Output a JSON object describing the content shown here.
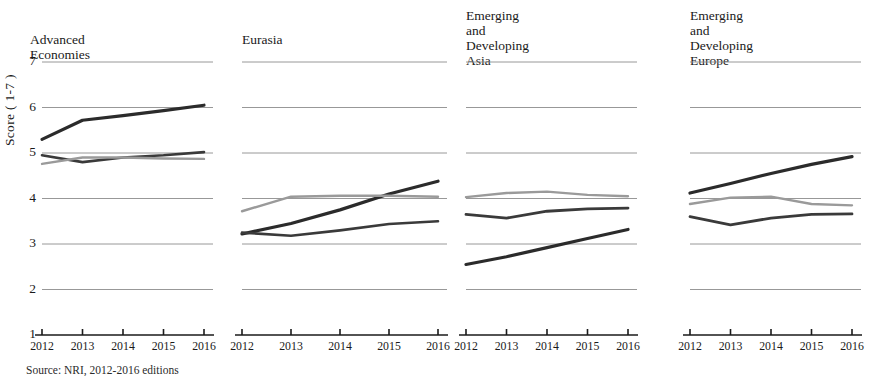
{
  "figure": {
    "ylabel": "Score ( 1-7 )",
    "source_note": "Source: NRI, 2012-2016 editions"
  },
  "chart_data": {
    "type": "line",
    "title": "",
    "xlabel": "",
    "ylabel": "Score ( 1-7 )",
    "ylim": [
      1,
      7
    ],
    "yticks": [
      1,
      2,
      3,
      4,
      5,
      6,
      7
    ],
    "grid": true,
    "legend_position": "none",
    "x": [
      "2012",
      "2013",
      "2014",
      "2015",
      "2016"
    ],
    "colors": {
      "series_dark": "#2b2b2b",
      "series_mid": "#4a4a4a",
      "series_light": "#9a9a9a",
      "gridline": "#8c8c8c",
      "axis": "#1a1a1a"
    },
    "panels": [
      {
        "title": "Advanced Economies",
        "series": [
          {
            "name": "series-1",
            "color": "#2b2b2b",
            "width": 3.2,
            "values": [
              5.3,
              5.72,
              5.82,
              5.93,
              6.05
            ]
          },
          {
            "name": "series-2",
            "color": "#3a3a3a",
            "width": 2.6,
            "values": [
              4.95,
              4.8,
              4.9,
              4.95,
              5.02
            ]
          },
          {
            "name": "series-3",
            "color": "#9a9a9a",
            "width": 2.4,
            "values": [
              4.76,
              4.9,
              4.9,
              4.88,
              4.87
            ]
          }
        ]
      },
      {
        "title": "Eurasia",
        "series": [
          {
            "name": "series-1",
            "color": "#2b2b2b",
            "width": 3.2,
            "values": [
              3.22,
              3.45,
              3.75,
              4.1,
              4.38
            ]
          },
          {
            "name": "series-2",
            "color": "#3a3a3a",
            "width": 2.6,
            "values": [
              3.25,
              3.18,
              3.3,
              3.44,
              3.5
            ]
          },
          {
            "name": "series-3",
            "color": "#9a9a9a",
            "width": 2.4,
            "values": [
              3.72,
              4.04,
              4.06,
              4.06,
              4.04
            ]
          }
        ]
      },
      {
        "title": "Emerging and\nDeveloping Asia",
        "series": [
          {
            "name": "series-1",
            "color": "#3a3a3a",
            "width": 2.8,
            "values": [
              3.65,
              3.57,
              3.72,
              3.77,
              3.79
            ]
          },
          {
            "name": "series-2",
            "color": "#2b2b2b",
            "width": 3.2,
            "values": [
              2.55,
              2.72,
              2.92,
              3.12,
              3.32
            ]
          },
          {
            "name": "series-3",
            "color": "#9a9a9a",
            "width": 2.4,
            "values": [
              4.03,
              4.12,
              4.15,
              4.08,
              4.05
            ]
          }
        ]
      },
      {
        "title": "Emerging and\nDeveloping Europe",
        "series": [
          {
            "name": "series-1",
            "color": "#2b2b2b",
            "width": 3.2,
            "values": [
              4.12,
              4.33,
              4.55,
              4.75,
              4.92
            ]
          },
          {
            "name": "series-2",
            "color": "#3a3a3a",
            "width": 2.8,
            "values": [
              3.6,
              3.42,
              3.57,
              3.65,
              3.66
            ]
          },
          {
            "name": "series-3",
            "color": "#9a9a9a",
            "width": 2.4,
            "values": [
              3.88,
              4.02,
              4.04,
              3.88,
              3.85
            ]
          }
        ]
      }
    ]
  },
  "layout": {
    "panels": [
      {
        "left": 34,
        "plot_left": 42,
        "plot_width": 162,
        "title_left": 30,
        "title_top": 32
      },
      {
        "left": 242,
        "plot_left": 242,
        "plot_width": 196,
        "title_left": 242,
        "title_top": 32
      },
      {
        "left": 466,
        "plot_left": 466,
        "plot_width": 162,
        "title_left": 466,
        "title_top": 8
      },
      {
        "left": 690,
        "plot_left": 690,
        "plot_width": 162,
        "title_left": 690,
        "title_top": 8
      }
    ],
    "plot_top": 62,
    "plot_bottom": 335
  }
}
